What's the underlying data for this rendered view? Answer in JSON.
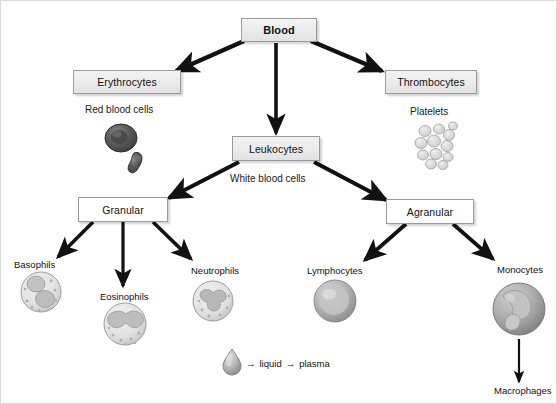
{
  "diagram": {
    "root": {
      "label": "Blood"
    },
    "branches": {
      "erythrocytes": {
        "label": "Erythrocytes",
        "caption": "Red blood cells",
        "figure": "red-blood-cell"
      },
      "leukocytes": {
        "label": "Leukocytes",
        "caption": "White blood cells"
      },
      "thrombocytes": {
        "label": "Thrombocytes",
        "caption": "Platelets",
        "figure": "platelet-cluster"
      }
    },
    "leukocyte_types": {
      "granular": {
        "label": "Granular"
      },
      "agranular": {
        "label": "Agranular"
      }
    },
    "granulocytes": [
      {
        "label": "Basophils",
        "figure": "basophil-cell"
      },
      {
        "label": "Eosinophils",
        "figure": "eosinophil-cell"
      },
      {
        "label": "Neutrophils",
        "figure": "neutrophil-cell"
      }
    ],
    "agranulocytes": [
      {
        "label": "Lymphocytes",
        "figure": "lymphocyte-cell"
      },
      {
        "label": "Monocytes",
        "figure": "monocyte-cell"
      }
    ],
    "monocyte_derivative": {
      "label": "Macrophages"
    },
    "plasma_note": {
      "figure": "plasma-droplet",
      "arrow1": "→",
      "term1": "liquid",
      "arrow2": "→",
      "term2": "plasma"
    },
    "colors": {
      "arrow": "#111111",
      "box_border": "#9b9b9b",
      "box_fill": "#ebebeb",
      "background": "#ffffff",
      "cell_dark": "#555555",
      "cell_light": "#c9c9c9"
    }
  }
}
